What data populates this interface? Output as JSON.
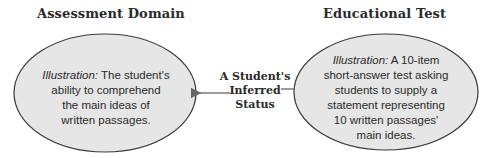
{
  "diagram": {
    "left": {
      "heading": "Assessment Domain",
      "illustration_label": "Illustration:",
      "lines": [
        " The student's",
        "ability to comprehend",
        "the main ideas of",
        "written passages."
      ]
    },
    "right": {
      "heading": "Educational Test",
      "illustration_label": "Illustration:",
      "lines": [
        " A 10-item",
        "short-answer test asking",
        "students to supply a",
        "statement representing",
        "10 written passages'",
        "main ideas."
      ]
    },
    "connector": {
      "lines": [
        "A Student's",
        "Inferred",
        "Status"
      ],
      "direction": "right-to-left"
    },
    "colors": {
      "ellipse_fill": "#e6e6e6",
      "ellipse_stroke": "#3a3a3a",
      "arrow": "#555555"
    }
  }
}
